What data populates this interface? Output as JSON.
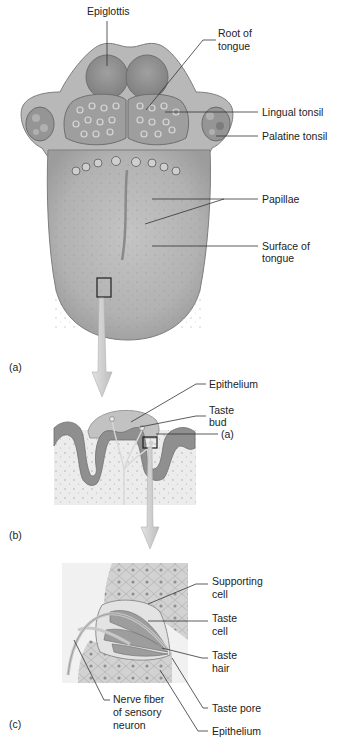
{
  "figure": {
    "panels": [
      {
        "id": "a",
        "marker": "(a)",
        "title": "Tongue, dorsal surface"
      },
      {
        "id": "b",
        "marker": "(b)",
        "title": "Papilla cross-section"
      },
      {
        "id": "c",
        "marker": "(c)",
        "title": "Taste bud detail"
      }
    ],
    "panel_a_labels": {
      "epiglottis": "Epiglottis",
      "root_of_tongue_1": "Root of",
      "root_of_tongue_2": "tongue",
      "lingual_tonsil": "Lingual tonsil",
      "palatine_tonsil": "Palatine tonsil",
      "papillae": "Papillae",
      "surface_1": "Surface of",
      "surface_2": "tongue"
    },
    "panel_b_labels": {
      "epithelium": "Epithelium",
      "taste_bud_1": "Taste",
      "taste_bud_2": "bud",
      "papilla": "Papilla"
    },
    "panel_c_labels": {
      "supporting_1": "Supporting",
      "supporting_2": "cell",
      "taste_cell_1": "Taste",
      "taste_cell_2": "cell",
      "taste_hair_1": "Taste",
      "taste_hair_2": "hair",
      "taste_pore": "Taste pore",
      "epithelium": "Epithelium",
      "nerve_1": "Nerve fiber",
      "nerve_2": "of sensory",
      "nerve_3": "neuron"
    },
    "colors": {
      "tissue_light": "#c9c9c9",
      "tissue_mid": "#a6a6a6",
      "tissue_dark": "#7a7a7a",
      "leader_line": "#333333",
      "arrow_fill": "#d6d6d6"
    }
  }
}
